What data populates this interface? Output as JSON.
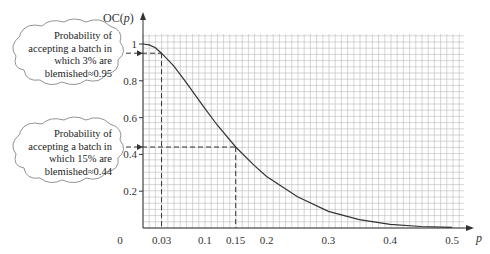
{
  "chart_data": {
    "type": "line",
    "title": "",
    "xlabel": "p",
    "ylabel": "OC(p)",
    "xlim": [
      0,
      0.5
    ],
    "ylim": [
      0,
      1
    ],
    "grid": true,
    "x_ticks": [
      "0",
      "0.03",
      "0.1",
      "0.15",
      "0.2",
      "0.3",
      "0.4",
      "0.5"
    ],
    "y_ticks": [
      "0.2",
      "0.4",
      "0.6",
      "0.8",
      "1"
    ],
    "series": [
      {
        "name": "OC(p)",
        "x": [
          0,
          0.01,
          0.02,
          0.03,
          0.05,
          0.07,
          0.1,
          0.12,
          0.15,
          0.18,
          0.2,
          0.25,
          0.3,
          0.35,
          0.4,
          0.45,
          0.5
        ],
        "values": [
          1.0,
          0.995,
          0.98,
          0.95,
          0.88,
          0.79,
          0.65,
          0.56,
          0.44,
          0.34,
          0.28,
          0.17,
          0.09,
          0.045,
          0.02,
          0.008,
          0.003
        ]
      }
    ],
    "annotations": [
      {
        "x": 0.03,
        "y": 0.95,
        "text": [
          "Probability of",
          "accepting a batch in",
          "which 3% are",
          "blemished≈0.95"
        ]
      },
      {
        "x": 0.15,
        "y": 0.44,
        "text": [
          "Probability of",
          "accepting a batch in",
          "which 15% are",
          "blemished≈0.44"
        ]
      }
    ]
  },
  "axis": {
    "y_label": "OC(",
    "y_label_p": "p",
    "y_label_close": ")",
    "x_label": "p",
    "origin": "0"
  },
  "callouts": [
    {
      "lines": [
        "Probability of",
        "accepting a batch in",
        "which 3% are",
        "blemished≈0.95"
      ]
    },
    {
      "lines": [
        "Probability of",
        "accepting a batch in",
        "which 15% are",
        "blemished≈0.44"
      ]
    }
  ]
}
